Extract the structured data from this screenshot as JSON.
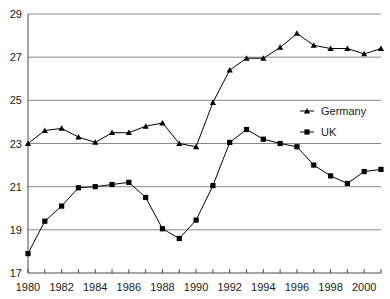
{
  "chart_data": {
    "type": "line",
    "title": "",
    "subtitle": "",
    "xlabel": "",
    "ylabel": "",
    "xlim": [
      1980,
      2001
    ],
    "ylim": [
      17,
      29
    ],
    "yticks": [
      17,
      19,
      21,
      23,
      25,
      27,
      29
    ],
    "ytick_labels": [
      "17",
      "19",
      "21",
      "23",
      "25",
      "27",
      "29"
    ],
    "xticks": [
      1980,
      1981,
      1982,
      1983,
      1984,
      1985,
      1986,
      1987,
      1988,
      1989,
      1990,
      1991,
      1992,
      1993,
      1994,
      1995,
      1996,
      1997,
      1998,
      1999,
      2000,
      2001
    ],
    "xtick_labels": [
      "1980",
      "",
      "1982",
      "",
      "1984",
      "",
      "1986",
      "",
      "1988",
      "",
      "1990",
      "",
      "1992",
      "",
      "1994",
      "",
      "1996",
      "",
      "1998",
      "",
      "2000",
      ""
    ],
    "x": [
      1980,
      1981,
      1982,
      1983,
      1984,
      1985,
      1986,
      1987,
      1988,
      1989,
      1990,
      1991,
      1992,
      1993,
      1994,
      1995,
      1996,
      1997,
      1998,
      1999,
      2000,
      2001
    ],
    "grid": "horizontal",
    "legend_position": "right-upper",
    "series": [
      {
        "name": "Germany",
        "marker": "triangle",
        "color": "#000000",
        "values": [
          23.0,
          23.6,
          23.7,
          23.3,
          23.05,
          23.5,
          23.5,
          23.8,
          23.95,
          23.0,
          22.85,
          24.9,
          26.4,
          26.95,
          26.95,
          27.45,
          28.1,
          27.55,
          27.4,
          27.4,
          27.15,
          27.4
        ]
      },
      {
        "name": "UK",
        "marker": "square",
        "color": "#000000",
        "values": [
          17.9,
          19.4,
          20.1,
          20.95,
          21.0,
          21.1,
          21.2,
          20.5,
          19.05,
          18.6,
          19.45,
          21.05,
          23.05,
          23.65,
          23.2,
          23.0,
          22.85,
          22.0,
          21.5,
          21.15,
          21.7,
          21.8
        ]
      }
    ]
  },
  "legend": {
    "items": [
      {
        "label": "Germany"
      },
      {
        "label": "UK"
      }
    ]
  },
  "axes": {
    "y_axis_name": "value-axis",
    "x_axis_name": "year-axis"
  }
}
